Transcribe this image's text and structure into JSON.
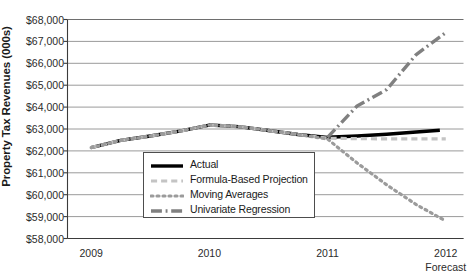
{
  "chart_data": {
    "type": "line",
    "title": "",
    "xlabel": "",
    "ylabel": "Property Tax Revenues (000s)",
    "ylim": [
      58000,
      68000
    ],
    "ytick_values": [
      58000,
      59000,
      60000,
      61000,
      62000,
      63000,
      64000,
      65000,
      66000,
      67000,
      68000
    ],
    "ytick_labels": [
      "$58,000",
      "$59,000",
      "$60,000",
      "$61,000",
      "$62,000",
      "$63,000",
      "$64,000",
      "$65,000",
      "$66,000",
      "$67,000",
      "$68,000"
    ],
    "xtick_values": [
      2009,
      2010,
      2011,
      2012
    ],
    "xtick_labels": [
      "2009",
      "2010",
      "2011",
      "2012"
    ],
    "xtick_sublabels": [
      "",
      "",
      "",
      "Forecast"
    ],
    "xlim": [
      2008.8,
      2012.15
    ],
    "grid": "horizontal",
    "legend_position": "center-left-inside",
    "series": [
      {
        "name": "Actual",
        "style": "solid",
        "color": "#000000",
        "width": 3.4,
        "x": [
          2009.0,
          2009.25,
          2009.5,
          2009.75,
          2010.0,
          2010.25,
          2010.5,
          2010.75,
          2011.0,
          2011.25,
          2011.5,
          2011.75,
          2011.95
        ],
        "y": [
          62150,
          62480,
          62680,
          62900,
          63180,
          63110,
          62930,
          62750,
          62620,
          62680,
          62760,
          62860,
          62940
        ]
      },
      {
        "name": "Formula-Based Projection",
        "style": "dashed",
        "color": "#c4c4c4",
        "width": 3.2,
        "x": [
          2009.0,
          2009.25,
          2009.5,
          2009.75,
          2010.0,
          2010.25,
          2010.5,
          2010.75,
          2011.0,
          2011.25,
          2011.5,
          2011.75,
          2012.0
        ],
        "y": [
          62150,
          62480,
          62680,
          62900,
          63180,
          63110,
          62930,
          62750,
          62580,
          62560,
          62550,
          62550,
          62550
        ]
      },
      {
        "name": "Moving Averages",
        "style": "dotted",
        "color": "#9b9b9b",
        "width": 3.2,
        "x": [
          2009.0,
          2009.25,
          2009.5,
          2009.75,
          2010.0,
          2010.25,
          2010.5,
          2010.75,
          2011.0,
          2011.25,
          2011.5,
          2011.75,
          2012.0
        ],
        "y": [
          62150,
          62480,
          62680,
          62900,
          63180,
          63110,
          62930,
          62750,
          62540,
          61450,
          60450,
          59550,
          58800
        ]
      },
      {
        "name": "Univariate Regression",
        "style": "dashdot",
        "color": "#808080",
        "width": 3.4,
        "x": [
          2011.0,
          2011.25,
          2011.5,
          2011.75,
          2012.0
        ],
        "y": [
          62620,
          64050,
          64800,
          66400,
          67400
        ]
      }
    ]
  },
  "legend": {
    "items": [
      {
        "label": "Actual",
        "swatch": "solid-black-line-swatch"
      },
      {
        "label": "Formula-Based Projection",
        "swatch": "light-gray-dashed-line-swatch"
      },
      {
        "label": "Moving Averages",
        "swatch": "gray-dotted-line-swatch"
      },
      {
        "label": "Univariate Regression",
        "swatch": "gray-dashdot-line-swatch"
      }
    ]
  }
}
